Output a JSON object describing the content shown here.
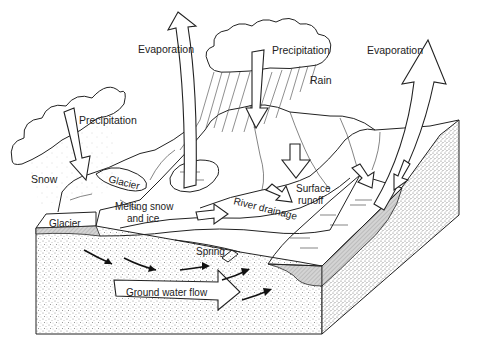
{
  "diagram": {
    "labels": {
      "evaporation_left": "Evaporation",
      "evaporation_right": "Evaporation",
      "precipitation_left": "Precipitation",
      "precipitation_center": "Precipitation",
      "rain": "Rain",
      "snow": "Snow",
      "glacier_upper": "Glacier",
      "glacier_lower": "Glacier",
      "melting_line1": "Melting snow",
      "melting_line2": "and ice",
      "river_drainage": "River drainage",
      "surface_runoff_line1": "Surface",
      "surface_runoff_line2": "runoff",
      "spring": "Spring",
      "ground_water_flow": "Ground water flow"
    },
    "colors": {
      "line": "#222222",
      "background": "#ffffff",
      "stipple": "#9a9a9a",
      "water_hatch": "#b8b8b8"
    }
  }
}
